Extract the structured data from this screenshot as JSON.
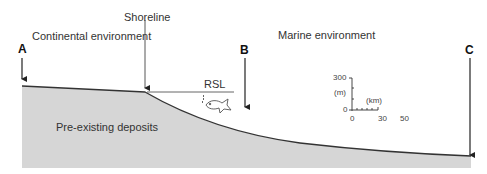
{
  "labels": {
    "continental": "Continental environment",
    "marine": "Marine environment",
    "shoreline": "Shoreline",
    "rsl": "RSL",
    "deposits": "Pre-existing deposits"
  },
  "markers": {
    "a": "A",
    "b": "B",
    "c": "C"
  },
  "scale": {
    "y_max": "300",
    "y_unit": "(m)",
    "y_min": "0",
    "x_unit": "(km)",
    "x_ticks": [
      "0",
      "30",
      "50"
    ]
  },
  "icons": {
    "fish": "fish-icon"
  },
  "colors": {
    "deposits_fill": "#d6d6d6",
    "line": "#222222",
    "text": "#333333"
  }
}
